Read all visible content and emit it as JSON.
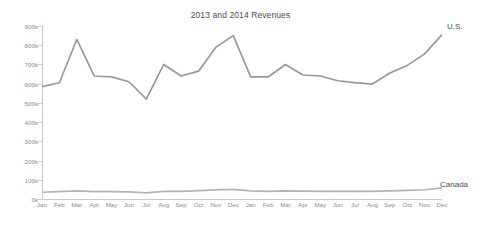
{
  "chart_data": {
    "type": "line",
    "title": "2013 and 2014 Revenues",
    "xlabel": "",
    "ylabel": "",
    "ylim": [
      0,
      900000
    ],
    "grid": false,
    "legend_position": "right-inline",
    "categories": [
      "Jan",
      "Feb",
      "Mar",
      "Apr",
      "May",
      "Jun",
      "Jul",
      "Aug",
      "Sep",
      "Oct",
      "Nov",
      "Dec",
      "Jan",
      "Feb",
      "Mar",
      "Apr",
      "May",
      "Jun",
      "Jul",
      "Aug",
      "Sep",
      "Oct",
      "Nov",
      "Dec"
    ],
    "ytick_labels": [
      "900k",
      "800k",
      "700k",
      "600k",
      "500k",
      "400k",
      "300k",
      "200k",
      "100k",
      "0k"
    ],
    "ytick_values": [
      900000,
      800000,
      700000,
      600000,
      500000,
      400000,
      300000,
      200000,
      100000,
      0
    ],
    "series": [
      {
        "name": "U.S.",
        "label": "U.S.",
        "color": "#999999",
        "values": [
          585000,
          605000,
          830000,
          640000,
          635000,
          610000,
          520000,
          700000,
          640000,
          665000,
          790000,
          850000,
          635000,
          635000,
          700000,
          645000,
          640000,
          615000,
          605000,
          598000,
          655000,
          695000,
          755000,
          855000
        ]
      },
      {
        "name": "Canada",
        "label": "Canada",
        "color": "#b3b3b3",
        "values": [
          35000,
          38000,
          42000,
          38000,
          38000,
          37000,
          32000,
          40000,
          40000,
          44000,
          47000,
          50000,
          42000,
          40000,
          42000,
          41000,
          40000,
          40000,
          40000,
          40000,
          42000,
          45000,
          48000,
          58000
        ]
      }
    ]
  },
  "colors": {
    "axis": "#c8c8c8",
    "tick_text": "#8c8c8c",
    "title_text": "#4d4d4d",
    "background": "#ffffff"
  }
}
